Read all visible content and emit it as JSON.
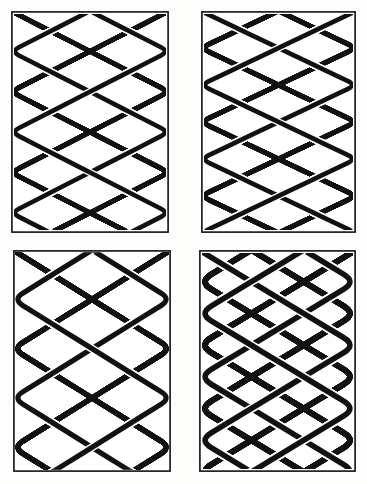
{
  "plate": {
    "title": "Celtic Interlace Plaitwork Panels",
    "description": "Four rectangular knotwork panels of woven interlace, black strands on white ground",
    "background_color": "#fdfdfb",
    "ink_color": "#111111",
    "paper_color": "#ffffff",
    "width": 367,
    "height": 484,
    "columns": 2,
    "rows": 2
  },
  "chart_data": {
    "type": "diagram",
    "panel_count": 4,
    "grid": [
      2,
      2
    ]
  },
  "panels": [
    {
      "id": "panel-top-left",
      "label": "Panel 1",
      "position": "top-left",
      "x": 11,
      "y": 11,
      "width": 158,
      "height": 222,
      "cell_w": 39.5,
      "cell_h": 19.5,
      "cols": 4,
      "rows": 11,
      "stroke_width": 4.6,
      "gap_width": 7.2,
      "edge_style": "closed-loops",
      "weave": "diagonal-plait",
      "density": "fine"
    },
    {
      "id": "panel-top-right",
      "label": "Panel 2",
      "position": "top-right",
      "x": 201,
      "y": 11,
      "width": 155,
      "height": 222,
      "cell_w": 38.8,
      "cell_h": 19.3,
      "cols": 4,
      "rows": 11,
      "stroke_width": 4.6,
      "gap_width": 7.2,
      "edge_style": "closed-loops",
      "weave": "diagonal-plait",
      "density": "fine"
    },
    {
      "id": "panel-bottom-left",
      "label": "Panel 3",
      "position": "bottom-left",
      "x": 13,
      "y": 250,
      "width": 158,
      "height": 222,
      "cell_w": 45.0,
      "cell_h": 25.0,
      "cols": 3,
      "rows": 9,
      "stroke_width": 5.2,
      "gap_width": 8.0,
      "edge_style": "open-cut",
      "weave": "diagonal-plait",
      "density": "medium"
    },
    {
      "id": "panel-bottom-right",
      "label": "Panel 4",
      "position": "bottom-right",
      "x": 199,
      "y": 250,
      "width": 157,
      "height": 222,
      "cell_w": 52.0,
      "cell_h": 31.0,
      "cols": 3,
      "rows": 7,
      "stroke_width": 5.6,
      "gap_width": 8.8,
      "edge_style": "closed-loops",
      "weave": "diagonal-plait",
      "density": "coarse"
    }
  ]
}
